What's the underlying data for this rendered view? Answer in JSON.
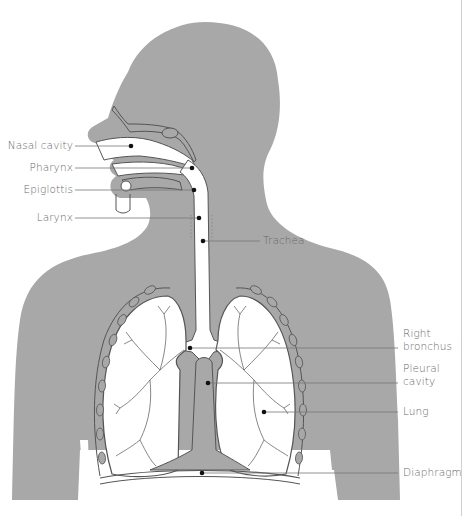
{
  "diagram": {
    "type": "anatomical-diagram",
    "colors": {
      "body": "#a8a8a8",
      "airway": "#ffffff",
      "outline": "#555555",
      "label_text": "#6a6a6a",
      "leader_line": "#777777",
      "dot": "#111111"
    },
    "labels_left": [
      {
        "id": "nasal-cavity",
        "text": "Nasal cavity"
      },
      {
        "id": "pharynx",
        "text": "Pharynx"
      },
      {
        "id": "epiglottis",
        "text": "Epiglottis"
      },
      {
        "id": "larynx",
        "text": "Larynx"
      }
    ],
    "labels_right": [
      {
        "id": "trachea",
        "text": "Trachea"
      },
      {
        "id": "right-bronchus-1",
        "text": "Right"
      },
      {
        "id": "right-bronchus-2",
        "text": "bronchus"
      },
      {
        "id": "pleural-cavity-1",
        "text": "Pleural"
      },
      {
        "id": "pleural-cavity-2",
        "text": "cavity"
      },
      {
        "id": "lung",
        "text": "Lung"
      },
      {
        "id": "diaphragm",
        "text": "Diaphragm"
      }
    ]
  }
}
